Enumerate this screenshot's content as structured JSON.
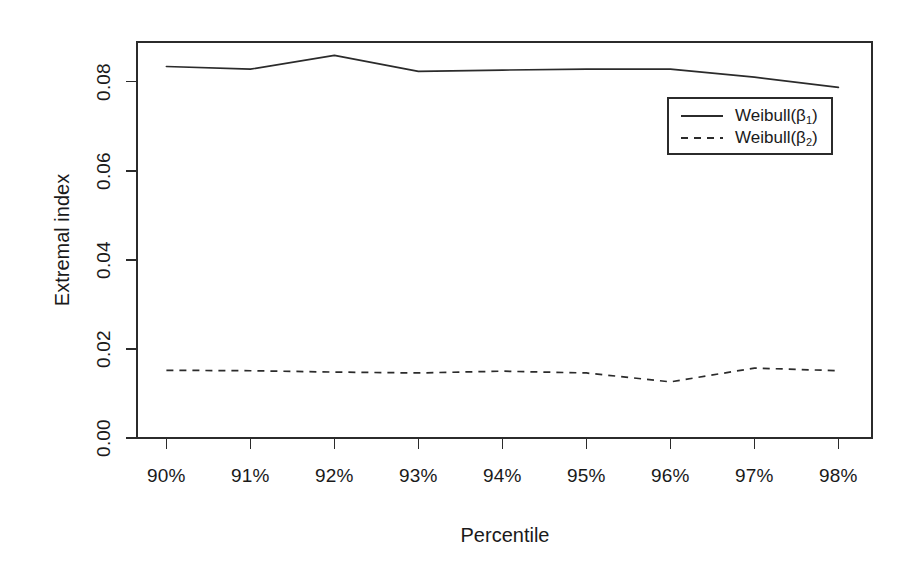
{
  "chart_data": {
    "type": "line",
    "title": "",
    "xlabel": "Percentile",
    "ylabel": "Extremal index",
    "categories": [
      "90%",
      "91%",
      "92%",
      "93%",
      "94%",
      "95%",
      "96%",
      "97%",
      "98%"
    ],
    "x": [
      90,
      91,
      92,
      93,
      94,
      95,
      96,
      97,
      98
    ],
    "xlim": [
      89.65,
      98.4
    ],
    "ylim": [
      0.0,
      0.0889
    ],
    "ytick_labels": [
      "0.00",
      "0.02",
      "0.04",
      "0.06",
      "0.08"
    ],
    "ytick_values": [
      0.0,
      0.02,
      0.04,
      0.06,
      0.08
    ],
    "xtick_labels": [
      "90%",
      "91%",
      "92%",
      "93%",
      "94%",
      "95%",
      "96%",
      "97%",
      "98%"
    ],
    "grid": false,
    "legend_position": "top-right",
    "series": [
      {
        "name": "Weibull(β1)",
        "label_base": "Weibull(β",
        "label_sub": "1",
        "label_close": ")",
        "style": "solid",
        "color": "#2b2b2b",
        "values": [
          0.0834,
          0.0828,
          0.0859,
          0.0823,
          0.0826,
          0.0828,
          0.0828,
          0.081,
          0.0787
        ]
      },
      {
        "name": "Weibull(β2)",
        "label_base": "Weibull(β",
        "label_sub": "2",
        "label_close": ")",
        "style": "dashed",
        "color": "#2b2b2b",
        "values": [
          0.0152,
          0.0151,
          0.0148,
          0.0146,
          0.015,
          0.0146,
          0.0126,
          0.0157,
          0.0151
        ]
      }
    ]
  },
  "axes": {
    "x_title": "Percentile",
    "y_title": "Extremal index"
  },
  "legend": {
    "entries": [
      {
        "label": "Weibull(β1)",
        "base": "Weibull(β",
        "sub": "1",
        "close": ")",
        "style": "solid"
      },
      {
        "label": "Weibull(β2)",
        "base": "Weibull(β",
        "sub": "2",
        "close": ")",
        "style": "dashed"
      }
    ]
  },
  "colors": {
    "ink": "#2b2b2b",
    "background": "#ffffff"
  }
}
